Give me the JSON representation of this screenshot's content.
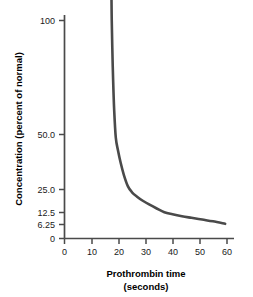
{
  "chart_data": {
    "type": "line",
    "title": "",
    "subtitle": "",
    "xlabel": "Prothrombin time",
    "xlabel_line2": "(seconds)",
    "ylabel": "Concentration (percent of normal)",
    "xlim": [
      0,
      62
    ],
    "ylim_scale": "log2-like (halving) axis from 6.25 to 100, with a 0 baseline tick",
    "x_ticks": [
      0,
      10,
      20,
      30,
      40,
      50,
      60
    ],
    "x_tick_labels": [
      "0",
      "10",
      "20",
      "30",
      "40",
      "50",
      "60"
    ],
    "y_ticks": [
      0,
      6.25,
      12.5,
      25.0,
      50.0,
      100
    ],
    "y_tick_labels": [
      "0",
      "6.25",
      "12.5",
      "25.0",
      "50.0",
      "100"
    ],
    "grid": false,
    "legend": null,
    "series": [
      {
        "name": "Concentration vs prothrombin time",
        "color": "#4a4a4a",
        "x": [
          17.4,
          17.5,
          17.7,
          18.0,
          18.4,
          19.0,
          19.8,
          20.8,
          22.0,
          23.5,
          25.0,
          27.0,
          29.0,
          31.5,
          34.0,
          37.0,
          40.0,
          43.5,
          47.0,
          51.0,
          55.0,
          59.5
        ],
        "y": [
          115.0,
          100.0,
          85.0,
          70.0,
          58.0,
          48.0,
          41.0,
          35.0,
          30.0,
          26.0,
          23.0,
          20.0,
          17.8,
          15.8,
          14.2,
          12.6,
          11.3,
          10.1,
          9.2,
          8.3,
          7.5,
          6.5
        ]
      }
    ],
    "annotations": [],
    "colors": {
      "curve": "#4a4a4a",
      "axis": "#4a4a4a",
      "text": "#1a1a1a",
      "background": "#ffffff"
    }
  },
  "axes": {
    "y_axis_title": "Concentration (percent of normal)",
    "x_axis_title_line1": "Prothrombin time",
    "x_axis_title_line2": "(seconds)",
    "y_tick_label_100": "100",
    "y_tick_label_50": "50.0",
    "y_tick_label_25": "25.0",
    "y_tick_label_12_5": "12.5",
    "y_tick_label_6_25": "6.25",
    "y_tick_label_0": "0",
    "x_tick_label_0": "0",
    "x_tick_label_10": "10",
    "x_tick_label_20": "20",
    "x_tick_label_30": "30",
    "x_tick_label_40": "40",
    "x_tick_label_50": "50",
    "x_tick_label_60": "60"
  }
}
